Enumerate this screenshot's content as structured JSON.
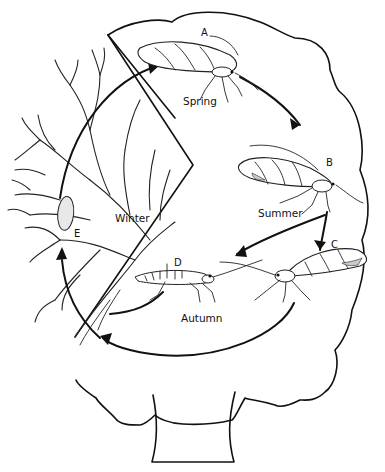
{
  "diagram": {
    "type": "life-cycle",
    "stages": [
      {
        "id": "A",
        "season": "Spring"
      },
      {
        "id": "B",
        "season": "Summer"
      },
      {
        "id": "C",
        "season": ""
      },
      {
        "id": "D",
        "season": "Autumn"
      },
      {
        "id": "E",
        "season": "Winter"
      }
    ],
    "labels": {
      "spring": "Spring",
      "summer": "Summer",
      "autumn": "Autumn",
      "winter": "Winter"
    },
    "letters": {
      "a": "A",
      "b": "B",
      "c": "C",
      "d": "D",
      "e": "E"
    },
    "colors": {
      "line": "#111111",
      "background": "#ffffff"
    }
  }
}
